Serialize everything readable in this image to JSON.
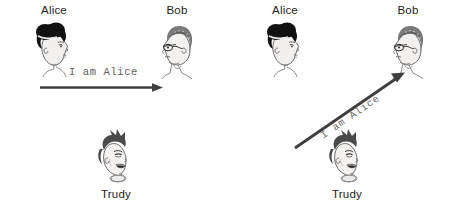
{
  "figure": {
    "background_color": "#ffffff",
    "ink_color": "#3a3a3a",
    "label_color": "#1c1c1c",
    "message_color": "#5e5e5e"
  },
  "panels": [
    {
      "id": "legitimate-authentication",
      "actors": [
        {
          "name": "alice",
          "label": "Alice",
          "label_position": "above",
          "icon": "alice-head-icon",
          "facing": "right"
        },
        {
          "name": "bob",
          "label": "Bob",
          "label_position": "above",
          "icon": "bob-head-icon",
          "facing": "left"
        },
        {
          "name": "trudy",
          "label": "Trudy",
          "label_position": "below",
          "icon": "trudy-head-icon",
          "facing": "right"
        }
      ],
      "message": {
        "text": "I am Alice",
        "from": "alice",
        "to": "bob",
        "arrow": "horizontal-arrow",
        "direction": "left-to-right"
      }
    },
    {
      "id": "impersonation-attack",
      "actors": [
        {
          "name": "alice",
          "label": "Alice",
          "label_position": "above",
          "icon": "alice-head-icon",
          "facing": "right"
        },
        {
          "name": "bob",
          "label": "Bob",
          "label_position": "above",
          "icon": "bob-head-icon",
          "facing": "left"
        },
        {
          "name": "trudy",
          "label": "Trudy",
          "label_position": "below",
          "icon": "trudy-head-icon",
          "facing": "right"
        }
      ],
      "message": {
        "text": "I am Alice",
        "from": "trudy",
        "to": "bob",
        "arrow": "diagonal-arrow",
        "direction": "lower-left-to-upper-right"
      }
    }
  ]
}
